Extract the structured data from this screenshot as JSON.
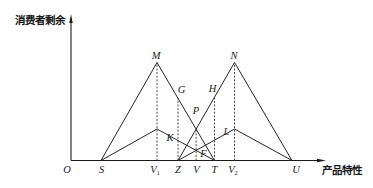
{
  "figure": {
    "y_axis": {
      "label": "消费者剩余"
    },
    "x_axis": {
      "label": "产品特性"
    },
    "origin_label": "O",
    "labels": {
      "M": "M",
      "N": "N",
      "G": "G",
      "H": "H",
      "P": "P",
      "K": "K",
      "L": "L",
      "F": "F",
      "S": "S",
      "V1": {
        "main": "V",
        "sub": "1"
      },
      "Z": "Z",
      "V": "V",
      "T": "T",
      "V2": {
        "main": "V",
        "sub": "2"
      },
      "U": "U"
    },
    "x_axis_points_order": [
      "O",
      "S",
      "V1",
      "Z",
      "V",
      "T",
      "V2",
      "U"
    ],
    "solid_paths": [
      {
        "id": "large-left",
        "vertices": [
          "S",
          "M",
          "T"
        ],
        "passes_through": [
          "G",
          "P"
        ]
      },
      {
        "id": "large-right",
        "vertices": [
          "Z",
          "N",
          "U"
        ],
        "passes_through": [
          "P",
          "H"
        ]
      },
      {
        "id": "small-left",
        "vertices": [
          "S",
          "peak above V1",
          "T"
        ],
        "passes_through": [
          "K",
          "F"
        ]
      },
      {
        "id": "small-right",
        "vertices": [
          "Z",
          "peak above V2",
          "U"
        ],
        "passes_through": [
          "F",
          "L"
        ]
      }
    ],
    "dashed_lines": [
      {
        "from": "V1",
        "to": "M"
      },
      {
        "from": "Z",
        "to": "G"
      },
      {
        "from": "V",
        "to": "P"
      },
      {
        "from": "T",
        "to": "H"
      },
      {
        "from": "V2",
        "to": "N"
      }
    ],
    "colors": {
      "line": "#262626",
      "background": "#ffffff"
    }
  }
}
